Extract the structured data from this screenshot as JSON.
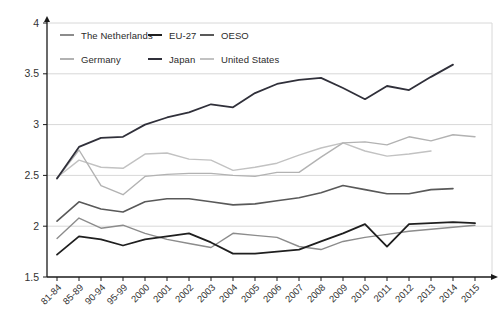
{
  "chart_data": {
    "type": "line",
    "title": "",
    "xlabel": "",
    "ylabel": "",
    "grid": true,
    "legend_position": "top-left-inside",
    "ylim": [
      1.5,
      4
    ],
    "yticks": [
      {
        "value": 4,
        "label": "4"
      },
      {
        "value": 3.5,
        "label": "3.5"
      },
      {
        "value": 3,
        "label": "3"
      },
      {
        "value": 2.5,
        "label": "2.5"
      },
      {
        "value": 2,
        "label": "2"
      },
      {
        "value": 1.5,
        "label": "1.5"
      }
    ],
    "categories": [
      "81-84",
      "85-89",
      "90-94",
      "95-99",
      "2000",
      "2001",
      "2002",
      "2003",
      "2004",
      "2005",
      "2006",
      "2007",
      "2008",
      "2009",
      "2010",
      "2011",
      "2012",
      "2013",
      "2014",
      "2015"
    ],
    "series": [
      {
        "id": "united-states",
        "name": "United States",
        "color": "#c2c2c2",
        "width": 1.4,
        "values": [
          2.48,
          2.65,
          2.58,
          2.57,
          2.71,
          2.72,
          2.66,
          2.65,
          2.55,
          2.58,
          2.62,
          2.7,
          2.77,
          2.82,
          2.74,
          2.69,
          2.71,
          2.74,
          null,
          null
        ]
      },
      {
        "id": "germany",
        "name": "Germany",
        "color": "#b2b2b2",
        "width": 1.4,
        "values": [
          2.47,
          2.75,
          2.4,
          2.31,
          2.49,
          2.51,
          2.52,
          2.52,
          2.5,
          2.49,
          2.53,
          2.53,
          2.68,
          2.82,
          2.83,
          2.8,
          2.88,
          2.84,
          2.9,
          2.88
        ]
      },
      {
        "id": "oeso",
        "name": "OESO",
        "color": "#595959",
        "width": 1.6,
        "values": [
          2.05,
          2.24,
          2.17,
          2.14,
          2.24,
          2.27,
          2.27,
          2.24,
          2.21,
          2.22,
          2.25,
          2.28,
          2.33,
          2.4,
          2.36,
          2.32,
          2.32,
          2.36,
          2.37,
          null
        ]
      },
      {
        "id": "netherlands",
        "name": "The Netherlands",
        "color": "#8c8c8c",
        "width": 1.4,
        "values": [
          1.88,
          2.08,
          1.98,
          2.01,
          1.93,
          1.87,
          1.83,
          1.79,
          1.93,
          1.91,
          1.89,
          1.8,
          1.77,
          1.85,
          1.89,
          1.92,
          1.95,
          1.97,
          1.99,
          2.01
        ]
      },
      {
        "id": "japan",
        "name": "Japan",
        "color": "#30303a",
        "width": 1.8,
        "values": [
          2.47,
          2.78,
          2.87,
          2.88,
          3.0,
          3.07,
          3.12,
          3.2,
          3.17,
          3.31,
          3.4,
          3.44,
          3.46,
          3.36,
          3.25,
          3.38,
          3.34,
          3.47,
          3.59,
          null
        ]
      },
      {
        "id": "eu-27",
        "name": "EU-27",
        "color": "#1f1f1f",
        "width": 1.8,
        "values": [
          1.72,
          1.9,
          1.87,
          1.81,
          1.87,
          1.9,
          1.93,
          1.84,
          1.73,
          1.73,
          1.75,
          1.77,
          1.85,
          1.93,
          2.02,
          1.8,
          2.02,
          2.03,
          2.04,
          2.03
        ]
      }
    ],
    "legend": [
      {
        "label": "The Netherlands",
        "color": "#8c8c8c"
      },
      {
        "label": "EU-27",
        "color": "#1f1f1f"
      },
      {
        "label": "OESO",
        "color": "#595959"
      },
      {
        "label": "Germany",
        "color": "#b2b2b2"
      },
      {
        "label": "Japan",
        "color": "#30303a"
      },
      {
        "label": "United States",
        "color": "#c2c2c2"
      }
    ],
    "colors": {
      "grid": "#d8d8d8",
      "axis": "#1a1a1a",
      "text": "#333333"
    }
  }
}
